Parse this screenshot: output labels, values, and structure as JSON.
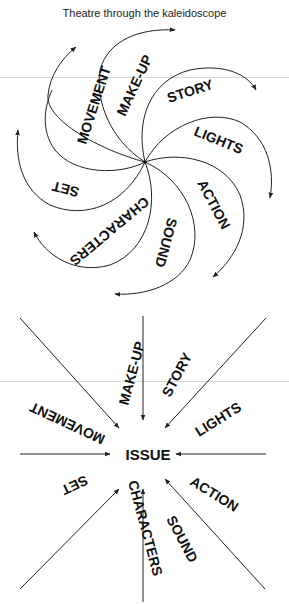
{
  "title": "Theatre through the kaleidoscope",
  "spiral": {
    "center": [
      145,
      162
    ],
    "labels": {
      "movement": "MOVEMENT",
      "makeup": "MAKE-UP",
      "story": "STORY",
      "lights": "LIGHTS",
      "action": "ACTION",
      "sound": "SOUND",
      "characters": "CHARACTERS",
      "set": "SET"
    }
  },
  "convergence": {
    "center_label": "ISSUE",
    "labels": {
      "makeup": "MAKE-UP",
      "story": "STORY",
      "movement": "MOVEMENT",
      "lights": "LIGHTS",
      "set": "SET",
      "characters": "CHARACTERS",
      "sound": "SOUND",
      "action": "ACTION"
    }
  },
  "colors": {
    "stroke": "#222222",
    "text": "#111111",
    "rule": "#d8d8d8"
  }
}
